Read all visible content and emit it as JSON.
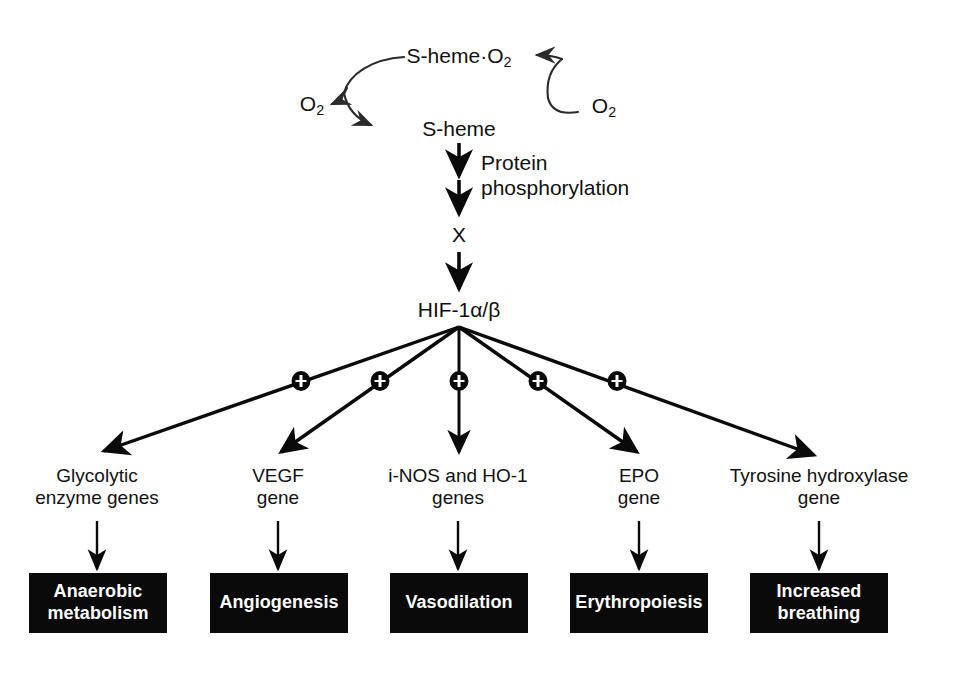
{
  "diagram": {
    "colors": {
      "stroke": "#0a0a0a",
      "box_fill": "#0a0a0a",
      "box_text": "#ffffff",
      "background": "#ffffff"
    },
    "cycle": {
      "bound_complex": "S-heme·O",
      "bound_complex_sub": "2",
      "free_sensor": "S-heme",
      "oxygen_released_label": "O",
      "oxygen_released_sub": "2",
      "oxygen_bound_label": "O",
      "oxygen_bound_sub": "2"
    },
    "signal_steps": {
      "phosphorylation_line1": "Protein",
      "phosphorylation_line2": "phosphorylation",
      "intermediate": "X",
      "transcription_factor": "HIF-1α/β"
    },
    "plus_symbol": "+",
    "branches": [
      {
        "gene_line1": "Glycolytic",
        "gene_line2": "enzyme genes",
        "outcome": "Anaerobic metabolism",
        "outcome_line1": "Anaerobic",
        "outcome_line2": "metabolism",
        "activation": "+"
      },
      {
        "gene_line1": "VEGF",
        "gene_line2": "gene",
        "outcome": "Angiogenesis",
        "outcome_line1": "Angiogenesis",
        "outcome_line2": "",
        "activation": "+"
      },
      {
        "gene_line1": "i-NOS and HO-1",
        "gene_line2": "genes",
        "outcome": "Vasodilation",
        "outcome_line1": "Vasodilation",
        "outcome_line2": "",
        "activation": "+"
      },
      {
        "gene_line1": "EPO",
        "gene_line2": "gene",
        "outcome": "Erythropoiesis",
        "outcome_line1": "Erythropoiesis",
        "outcome_line2": "",
        "activation": "+"
      },
      {
        "gene_line1": "Tyrosine hydroxylase",
        "gene_line2": "gene",
        "outcome": "Increased breathing",
        "outcome_line1": "Increased",
        "outcome_line2": "breathing",
        "activation": "+"
      }
    ]
  }
}
